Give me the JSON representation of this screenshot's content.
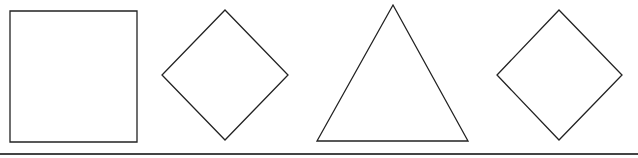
{
  "figure": {
    "width": 638,
    "height": 158,
    "stroke_color": "#222222",
    "baseline_color": "#444444",
    "shapes": [
      {
        "type": "square",
        "points": "10,11 137,11 137,142 10,142"
      },
      {
        "type": "diamond",
        "points": "225,10 288,75 225,140 162,75"
      },
      {
        "type": "triangle",
        "points": "393,5 468,141 317,141"
      },
      {
        "type": "diamond",
        "points": "559,10 622,75 559,140 497,75"
      }
    ],
    "baseline": {
      "x1": 0,
      "y1": 154,
      "x2": 638,
      "y2": 154
    }
  }
}
